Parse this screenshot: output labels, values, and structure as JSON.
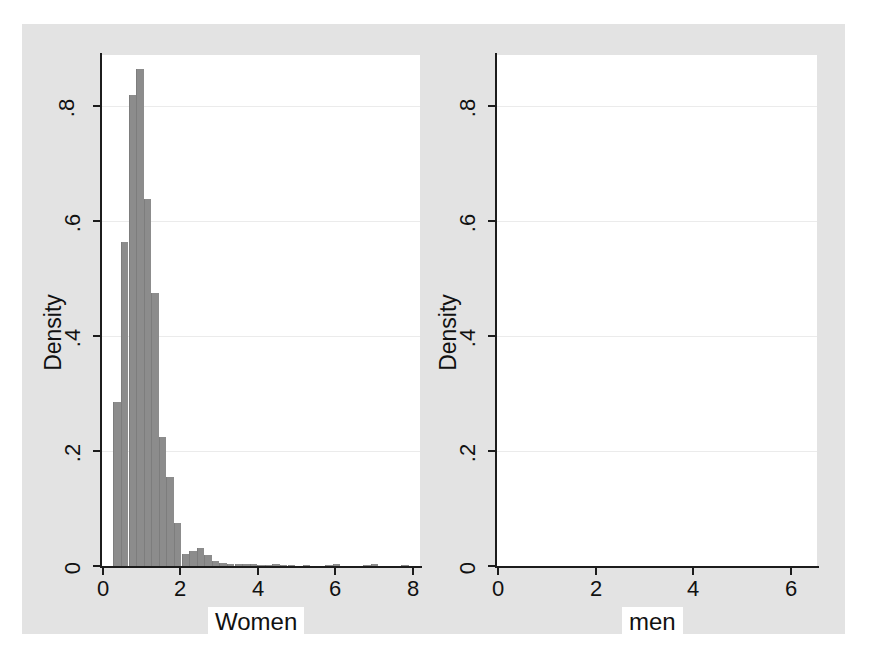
{
  "chart_data": [
    {
      "type": "bar",
      "title": "",
      "panel": "left",
      "xlabel": "Women",
      "ylabel": "Density",
      "xlim": [
        -0.1,
        8.3
      ],
      "ylim": [
        0,
        0.89
      ],
      "xticks": [
        "0",
        "2",
        "4",
        "6",
        "8"
      ],
      "xtick_values": [
        0,
        2,
        4,
        6,
        8
      ],
      "yticks": [
        "0",
        ".2",
        ".4",
        ".6",
        ".8"
      ],
      "ytick_values": [
        0,
        0.2,
        0.4,
        0.6,
        0.8
      ],
      "grid": true,
      "bin_width": 0.2,
      "x": [
        0.3,
        0.5,
        0.7,
        0.9,
        1.1,
        1.3,
        1.5,
        1.7,
        1.9,
        2.1,
        2.3,
        2.5,
        2.7,
        2.9,
        3.1,
        3.3,
        3.5,
        3.7,
        3.9,
        4.1,
        4.3,
        4.5,
        4.7,
        4.9,
        5.3,
        5.9,
        6.1,
        6.9,
        7.1,
        7.9
      ],
      "values": [
        0.285,
        0.565,
        0.82,
        0.865,
        0.64,
        0.475,
        0.225,
        0.155,
        0.075,
        0.021,
        0.026,
        0.031,
        0.019,
        0.009,
        0.005,
        0.004,
        0.004,
        0.003,
        0.003,
        0.002,
        0.002,
        0.003,
        0.002,
        0.002,
        0.002,
        0.002,
        0.003,
        0.002,
        0.003,
        0.002
      ]
    },
    {
      "type": "bar",
      "title": "",
      "panel": "right",
      "xlabel": "men",
      "ylabel": "Density",
      "xlim": [
        -0.1,
        6.6
      ],
      "ylim": [
        0,
        0.79
      ],
      "xticks": [
        "0",
        "2",
        "4",
        "6"
      ],
      "xtick_values": [
        0,
        2,
        4,
        6
      ],
      "yticks": [
        "0",
        ".2",
        ".4",
        ".6",
        ".8"
      ],
      "ytick_values": [
        0,
        0.2,
        0.4,
        0.6,
        0.8
      ],
      "grid": true,
      "bin_width": 0.2,
      "x": [
        0.35,
        0.55,
        0.75,
        0.95,
        1.15,
        1.35,
        1.55,
        1.75,
        1.95,
        2.15,
        2.35,
        2.55,
        2.75,
        2.95,
        3.15,
        3.35,
        3.55,
        3.75,
        3.95,
        4.15,
        4.35,
        4.75,
        5.15,
        5.55,
        5.75,
        6.15,
        6.35
      ],
      "values": [
        0.125,
        0.155,
        0.31,
        0.39,
        0.445,
        0.72,
        0.585,
        0.585,
        0.585,
        0.31,
        0.245,
        0.155,
        0.115,
        0.06,
        0.018,
        0.016,
        0.016,
        0.016,
        0.009,
        0.009,
        0.005,
        0.004,
        0.004,
        0.019,
        0.019,
        0.004,
        0.004
      ]
    }
  ],
  "style": {
    "figure_background": "#e3e3e3",
    "plot_background": "#ffffff",
    "bar_color": "#8c8c8c",
    "axis_color": "#1c1c1c",
    "grid_color": "#ebebeb",
    "text_color": "#111111"
  }
}
